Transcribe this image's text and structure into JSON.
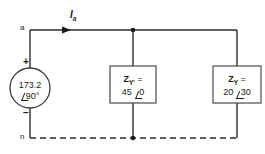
{
  "diagram": {
    "nodes": {
      "top_label": "a",
      "bottom_label": "n"
    },
    "current": {
      "symbol": "I",
      "subscript": "a",
      "direction": "right"
    },
    "source": {
      "magnitude": "173.2",
      "angle": "90°",
      "plus_sign": "+",
      "minus_sign": "−"
    },
    "branches": [
      {
        "name": "middle-impedance",
        "symbol": "Z",
        "subscript": "Y'",
        "equals": "=",
        "magnitude": "45",
        "angle": "0"
      },
      {
        "name": "right-impedance",
        "symbol": "Z",
        "subscript": "Y",
        "equals": "=",
        "magnitude": "20",
        "angle": "30"
      }
    ],
    "colors": {
      "wire": "#2b2b2b",
      "text": "#1a1a1a",
      "background": "#ffffff"
    }
  }
}
